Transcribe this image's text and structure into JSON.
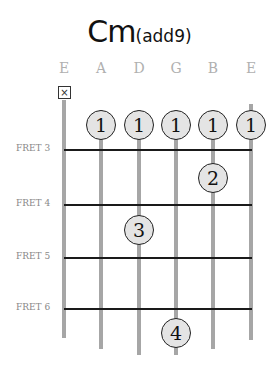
{
  "chord": {
    "name": "Cm",
    "suffix": "(add9)"
  },
  "strings": [
    {
      "name": "E",
      "x": 64,
      "top": 100,
      "bottom": 338
    },
    {
      "name": "A",
      "x": 101,
      "top": 110,
      "bottom": 349
    },
    {
      "name": "D",
      "x": 139,
      "top": 110,
      "bottom": 355
    },
    {
      "name": "G",
      "x": 176,
      "top": 110,
      "bottom": 355
    },
    {
      "name": "B",
      "x": 213,
      "top": 110,
      "bottom": 349
    },
    {
      "name": "E",
      "x": 251,
      "top": 104,
      "bottom": 340
    }
  ],
  "muted": {
    "string": 0,
    "symbol": "☒"
  },
  "frets": [
    {
      "label": "FRET 3",
      "y": 150
    },
    {
      "label": "FRET 4",
      "y": 205
    },
    {
      "label": "FRET 5",
      "y": 258
    },
    {
      "label": "FRET 6",
      "y": 309
    }
  ],
  "fingers": [
    {
      "finger": "1",
      "string": 1,
      "x": 101,
      "y": 125
    },
    {
      "finger": "1",
      "string": 2,
      "x": 139,
      "y": 125
    },
    {
      "finger": "1",
      "string": 3,
      "x": 176,
      "y": 125
    },
    {
      "finger": "1",
      "string": 4,
      "x": 213,
      "y": 125
    },
    {
      "finger": "1",
      "string": 5,
      "x": 251,
      "y": 125
    },
    {
      "finger": "2",
      "string": 4,
      "x": 213,
      "y": 178
    },
    {
      "finger": "3",
      "string": 1,
      "x": 139,
      "y": 230
    },
    {
      "finger": "4",
      "string": 3,
      "x": 176,
      "y": 333
    }
  ],
  "colors": {
    "string": "#a6a6a6",
    "fret": "#1a1a1a",
    "finger_fill": "#e4e4e4",
    "label": "#b0b0b0"
  }
}
